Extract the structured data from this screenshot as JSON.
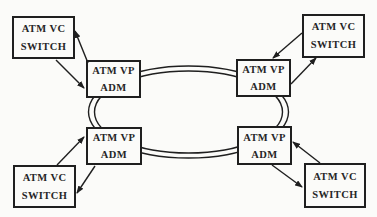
{
  "diagram": {
    "type": "network-topology",
    "colors": {
      "background": "#fbfbf9",
      "line": "#1f1f1f",
      "box_fill": "#fbfbf9",
      "text": "#262626"
    },
    "ring": {
      "style": "double-line ellipse",
      "connects": "four ATM VP ADM nodes"
    },
    "nodes": {
      "switch_tl": {
        "line1": "ATM VC",
        "line2": "SWITCH"
      },
      "switch_tr": {
        "line1": "ATM VC",
        "line2": "SWITCH"
      },
      "switch_bl": {
        "line1": "ATM VC",
        "line2": "SWITCH"
      },
      "switch_br": {
        "line1": "ATM VC",
        "line2": "SWITCH"
      },
      "adm_tl": {
        "line1": "ATM VP",
        "line2": "ADM"
      },
      "adm_tr": {
        "line1": "ATM VP",
        "line2": "ADM"
      },
      "adm_bl": {
        "line1": "ATM VP",
        "line2": "ADM"
      },
      "adm_br": {
        "line1": "ATM VP",
        "line2": "ADM"
      }
    }
  }
}
